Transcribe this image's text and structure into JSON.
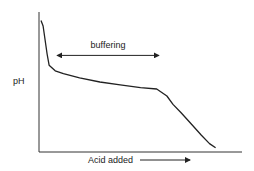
{
  "chart_data": {
    "type": "line",
    "title": "",
    "xlabel": "Acid added",
    "ylabel": "pH",
    "xlim": [
      0,
      100
    ],
    "ylim": [
      0,
      100
    ],
    "grid": false,
    "legend": "none",
    "series": [
      {
        "name": "titration curve",
        "x": [
          1,
          2,
          3,
          4,
          5,
          8,
          12,
          20,
          30,
          40,
          50,
          58,
          63,
          66,
          70,
          75,
          80,
          84,
          87
        ],
        "y": [
          94,
          90,
          80,
          70,
          62,
          58,
          56,
          53,
          50,
          48,
          46,
          45,
          40,
          34,
          28,
          20,
          12,
          6,
          3
        ]
      }
    ],
    "annotations": [
      {
        "text": "buffering",
        "type": "double-arrow",
        "x_start": 9,
        "x_end": 59,
        "y": 69
      },
      {
        "text": "Acid added",
        "type": "axis-arrow",
        "direction": "right"
      }
    ],
    "colors": {
      "line": "#222222",
      "axis": "#333333"
    }
  }
}
